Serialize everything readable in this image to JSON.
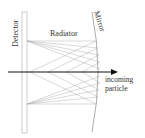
{
  "diagram": {
    "labels": {
      "detector": "Detector",
      "radiator": "Radiator",
      "mirror": "Mirror",
      "incoming_line1": "incoming",
      "incoming_line2": "particle"
    },
    "colors": {
      "lines": "#aaaaaa",
      "axis": "#111111",
      "text": "#333333",
      "background": "#ffffff"
    }
  }
}
